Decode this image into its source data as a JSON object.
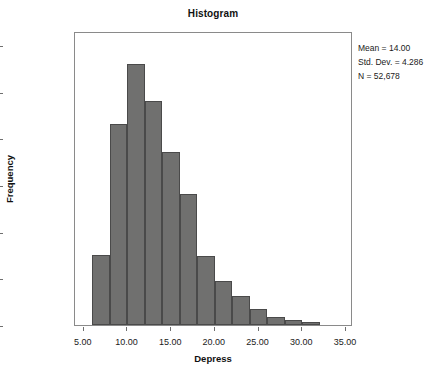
{
  "chart_data": {
    "type": "bar",
    "title": "Histogram",
    "xlabel": "Depress",
    "ylabel": "Frequency",
    "xlim": [
      4.0,
      35.8
    ],
    "ylim": [
      0,
      12600
    ],
    "grid": false,
    "legend": null,
    "bin_width": 2,
    "bar_color": "#70706f",
    "bar_edge_color": "#4a4a4a",
    "categories": [
      7,
      9,
      11,
      13,
      15,
      17,
      19,
      21,
      23,
      25,
      27,
      29,
      31
    ],
    "bin_starts": [
      6,
      8,
      10,
      12,
      14,
      16,
      18,
      20,
      22,
      24,
      26,
      28,
      30
    ],
    "values": [
      3000,
      8600,
      11200,
      9600,
      7400,
      5600,
      2950,
      1880,
      1250,
      700,
      350,
      230,
      150
    ],
    "xticks": [
      5,
      10,
      15,
      20,
      25,
      30,
      35
    ],
    "xticklabels": [
      "5.00",
      "10.00",
      "15.00",
      "20.00",
      "25.00",
      "30.00",
      "35.00"
    ],
    "yticks": [
      0,
      2000,
      4000,
      6000,
      8000,
      10000,
      12000
    ],
    "yticklabels": [
      "0",
      "2,000",
      "4,000",
      "6,000",
      "8,000",
      "10,000",
      "12,000"
    ],
    "annotations": [
      "Mean = 14.00",
      "Std. Dev. = 4.286",
      "N = 52,678"
    ]
  },
  "stats": {
    "mean_label": "Mean = 14.00",
    "stddev_label": "Std. Dev. = 4.286",
    "n_label": "N = 52,678"
  }
}
